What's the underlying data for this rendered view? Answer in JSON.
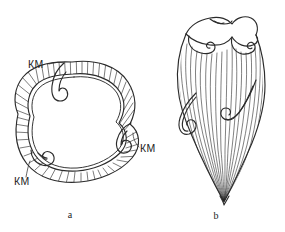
{
  "figure": {
    "background_color": "#ffffff",
    "ink_color": "#2b2b2b",
    "panels": [
      {
        "caption": "a",
        "view": "transverse cross-section",
        "description": "Rounded trilobate cross-section with a hatched outer shell band and three inward-curling scroll structures",
        "labels": [
          {
            "text": "КМ",
            "position": "upper-left"
          },
          {
            "text": "КМ",
            "position": "right"
          },
          {
            "text": "КМ",
            "position": "lower-left"
          }
        ]
      },
      {
        "caption": "b",
        "view": "lateral longitudinal",
        "description": "Elongate conical shell tapering to a pointed apex, covered with dense vertical ribbing, with a wavy scrolled rim at the top and two lateral curled flanges",
        "labels": []
      }
    ],
    "captions": {
      "left": "a",
      "right": "b"
    }
  }
}
